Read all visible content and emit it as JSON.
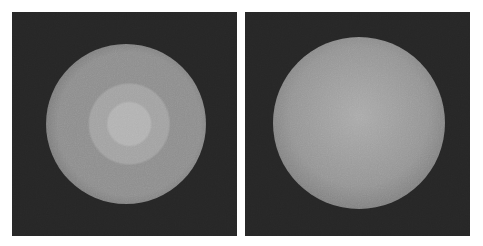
{
  "figure": {
    "background": "#ffffff",
    "panels": [
      {
        "name": "left-render",
        "x": 12,
        "y": 12,
        "width": 225,
        "height": 224,
        "background": "#262626",
        "sphere": {
          "cx": 126,
          "cy": 124,
          "r": 80,
          "center_color": "#b2b2b2",
          "mid_color": "#8e8e8e",
          "edge_color": "#565656",
          "banding": true
        }
      },
      {
        "name": "right-render",
        "x": 245,
        "y": 12,
        "width": 225,
        "height": 224,
        "background": "#262626",
        "sphere": {
          "cx": 359,
          "cy": 123,
          "r": 86,
          "center_color": "#aaaaaa",
          "mid_color": "#959595",
          "edge_color": "#5a5a5a",
          "banding": false
        }
      }
    ]
  }
}
